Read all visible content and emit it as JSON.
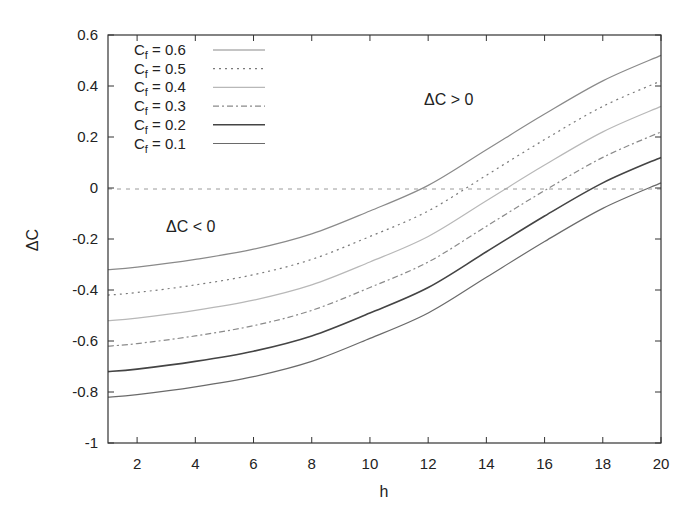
{
  "chart_data": {
    "type": "line",
    "title": "",
    "xlabel": "h",
    "ylabel": "ΔC",
    "xlim": [
      1,
      20
    ],
    "ylim": [
      -1,
      0.6
    ],
    "grid": false,
    "legend_position": "top-left (inside)",
    "x": [
      1,
      2,
      4,
      6,
      8,
      10,
      12,
      14,
      16,
      18,
      20
    ],
    "x_ticks": [
      "2",
      "4",
      "6",
      "8",
      "10",
      "12",
      "14",
      "16",
      "18",
      "20"
    ],
    "y_ticks": [
      "0.6",
      "0.4",
      "0.2",
      "0",
      "-0.2",
      "-0.4",
      "-0.6",
      "-0.8",
      "-1"
    ],
    "series": [
      {
        "name": "Cf = 0.6",
        "style": "solid-light",
        "values": [
          -0.32,
          -0.31,
          -0.28,
          -0.24,
          -0.18,
          -0.09,
          0.01,
          0.15,
          0.29,
          0.42,
          0.52
        ]
      },
      {
        "name": "Cf = 0.5",
        "style": "dotted",
        "values": [
          -0.42,
          -0.41,
          -0.38,
          -0.34,
          -0.28,
          -0.19,
          -0.09,
          0.05,
          0.19,
          0.32,
          0.42
        ]
      },
      {
        "name": "Cf = 0.4",
        "style": "solid-faint",
        "values": [
          -0.52,
          -0.51,
          -0.48,
          -0.44,
          -0.38,
          -0.29,
          -0.19,
          -0.05,
          0.09,
          0.22,
          0.32
        ]
      },
      {
        "name": "Cf = 0.3",
        "style": "dash-dot",
        "values": [
          -0.62,
          -0.61,
          -0.58,
          -0.54,
          -0.48,
          -0.39,
          -0.29,
          -0.15,
          -0.01,
          0.12,
          0.22
        ]
      },
      {
        "name": "Cf = 0.2",
        "style": "solid-dark",
        "values": [
          -0.72,
          -0.71,
          -0.68,
          -0.64,
          -0.58,
          -0.49,
          -0.39,
          -0.25,
          -0.11,
          0.02,
          0.12
        ]
      },
      {
        "name": "Cf = 0.1",
        "style": "solid-medium",
        "values": [
          -0.82,
          -0.81,
          -0.78,
          -0.74,
          -0.68,
          -0.59,
          -0.49,
          -0.35,
          -0.21,
          -0.08,
          0.02
        ]
      }
    ],
    "reference_line": {
      "y": 0,
      "style": "dashed"
    },
    "annotations": [
      {
        "text": "ΔC > 0",
        "x": 13.2,
        "y": 0.34
      },
      {
        "text": "ΔC < 0",
        "x": 3.9,
        "y": -0.15
      }
    ]
  },
  "legend": {
    "items": [
      {
        "prefix": "C",
        "sub": "f",
        "suffix": " = 0.6"
      },
      {
        "prefix": "C",
        "sub": "f",
        "suffix": " = 0.5"
      },
      {
        "prefix": "C",
        "sub": "f",
        "suffix": " = 0.4"
      },
      {
        "prefix": "C",
        "sub": "f",
        "suffix": " = 0.3"
      },
      {
        "prefix": "C",
        "sub": "f",
        "suffix": " = 0.2"
      },
      {
        "prefix": "C",
        "sub": "f",
        "suffix": " = 0.1"
      }
    ]
  },
  "axes": {
    "xlabel": "h",
    "ylabel": "ΔC"
  },
  "annotations": {
    "positive": "ΔC > 0",
    "negative": "ΔC < 0"
  }
}
